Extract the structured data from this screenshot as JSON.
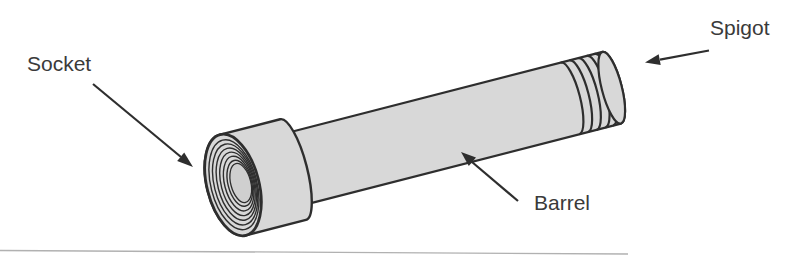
{
  "diagram": {
    "labels": {
      "socket": "Socket",
      "spigot": "Spigot",
      "barrel": "Barrel"
    },
    "colors": {
      "background": "#ffffff",
      "pipe_fill": "#d8d8d8",
      "outline": "#2e2e2e",
      "text": "#3a3a3a",
      "socket_bore": "#cfcfcf",
      "page_edge": "#9e9e9e"
    }
  }
}
